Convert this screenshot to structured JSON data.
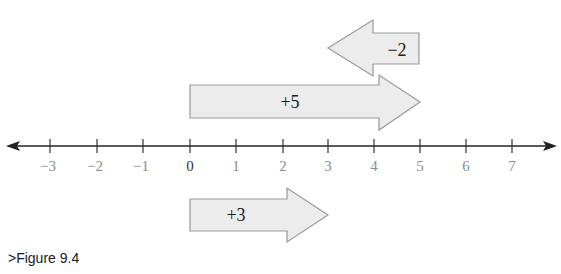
{
  "figure": {
    "caption": ">Figure 9.4",
    "colors": {
      "arrow_fill": "#ececec",
      "arrow_stroke": "#9a9a9a",
      "axis": "#222222",
      "tick_label": "#8c8c8c",
      "zero_label": "#333333"
    }
  },
  "number_line": {
    "ticks": [
      {
        "value": -3,
        "label": "−3"
      },
      {
        "value": -2,
        "label": "−2"
      },
      {
        "value": -1,
        "label": "−1"
      },
      {
        "value": 0,
        "label": "0"
      },
      {
        "value": 1,
        "label": "1"
      },
      {
        "value": 2,
        "label": "2"
      },
      {
        "value": 3,
        "label": "3"
      },
      {
        "value": 4,
        "label": "4"
      },
      {
        "value": 5,
        "label": "5"
      },
      {
        "value": 6,
        "label": "6"
      },
      {
        "value": 7,
        "label": "7"
      }
    ]
  },
  "arrows": {
    "minus2": {
      "label": "−2",
      "from": 5,
      "to": 3
    },
    "plus5": {
      "label": "+5",
      "from": 0,
      "to": 5
    },
    "plus3": {
      "label": "+3",
      "from": 0,
      "to": 3
    }
  }
}
